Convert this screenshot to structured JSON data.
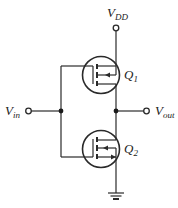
{
  "diagram": {
    "labels": {
      "vdd": {
        "main": "V",
        "sub": "DD"
      },
      "vin": {
        "main": "V",
        "sub": "in"
      },
      "vout": {
        "main": "V",
        "sub": "out"
      },
      "q1": {
        "main": "Q",
        "sub": "1"
      },
      "q2": {
        "main": "Q",
        "sub": "2"
      }
    },
    "components": [
      {
        "id": "Q1",
        "type": "PMOS transistor",
        "position": "top"
      },
      {
        "id": "Q2",
        "type": "NMOS transistor",
        "position": "bottom"
      }
    ],
    "nodes": [
      "VDD",
      "Vin",
      "Vout",
      "ground"
    ]
  }
}
